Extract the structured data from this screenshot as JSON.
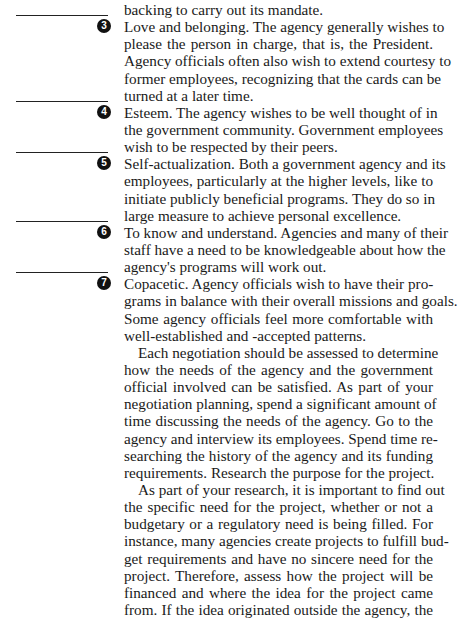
{
  "continuation": {
    "lines": [
      "backing to carry out its mandate."
    ]
  },
  "list_items": [
    {
      "number": "3",
      "lines": [
        "Love and belonging. The agency generally wishes to",
        "please the person in charge, that is, the President.",
        "Agency officials often also wish to extend courtesy to",
        "former employees, recognizing that the cards can be",
        "turned at a later time."
      ]
    },
    {
      "number": "4",
      "lines": [
        "Esteem. The agency wishes to be well thought of in",
        "the government community. Government employees",
        "wish to be respected by their peers."
      ]
    },
    {
      "number": "5",
      "lines": [
        "Self-actualization. Both a government agency and its",
        "employees, particularly at the higher levels, like to",
        "initiate publicly beneficial programs. They do so in",
        "large measure to achieve personal excellence."
      ]
    },
    {
      "number": "6",
      "lines": [
        "To know and understand. Agencies and many of their",
        "staff have a need to be knowledgeable about how the",
        "agency's programs will work out."
      ]
    },
    {
      "number": "7",
      "lines": [
        "Copacetic. Agency officials wish to have their pro-",
        "grams in balance with their overall missions and goals.",
        "Some agency officials feel more comfortable with",
        "well-established and -accepted patterns."
      ]
    }
  ],
  "paragraphs": [
    {
      "lines": [
        "Each negotiation should be assessed to determine",
        "how the needs of the agency and the government",
        "official involved can be satisfied. As part of your",
        "negotiation planning, spend a significant amount of",
        "time discussing the needs of the agency. Go to the",
        "agency and interview its employees. Spend time re-",
        "searching the history of the agency and its funding",
        "requirements. Research the purpose for the project."
      ]
    },
    {
      "lines": [
        "As part of your research, it is important to find out",
        "the specific need for the project, whether or not a",
        "budgetary or a regulatory need is being filled. For",
        "instance, many agencies create projects to fulfill bud-",
        "get requirements and have no sincere need for the",
        "project. Therefore, assess how the project will be",
        "financed and where the idea for the project came",
        "from. If the idea originated outside the agency, the"
      ]
    }
  ],
  "colors": {
    "text": "#1a1a1a",
    "badge_bg": "#111111",
    "badge_fg": "#ffffff",
    "rule": "#222222"
  }
}
